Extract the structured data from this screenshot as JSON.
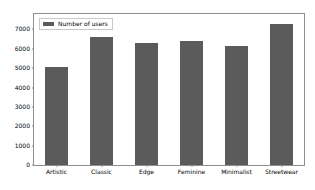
{
  "chart_data": {
    "type": "bar",
    "title": "",
    "xlabel": "",
    "ylabel": "",
    "categories": [
      "Artistic",
      "Classic",
      "Edge",
      "Feminine",
      "Minimalist",
      "Streetwear"
    ],
    "values": [
      5080,
      6620,
      6320,
      6430,
      6170,
      7280
    ],
    "series": [
      {
        "name": "Number of users",
        "values": [
          5080,
          6620,
          6320,
          6430,
          6170,
          7280
        ],
        "color": "#5b5b5b"
      }
    ],
    "ylim": [
      0,
      7800
    ],
    "yticks": [
      0,
      1000,
      2000,
      3000,
      4000,
      5000,
      6000,
      7000
    ],
    "ytick_labels": [
      "0",
      "1000",
      "2000",
      "3000",
      "4000",
      "5000",
      "6000",
      "7000"
    ],
    "grid": false,
    "legend": {
      "position": "upper left",
      "entries": [
        {
          "label": "Number of users",
          "swatch_name": "legend-swatch-number-of-users",
          "color": "#5b5b5b"
        }
      ]
    },
    "axes_color": "#8f8f8f",
    "background": "#ffffff"
  }
}
